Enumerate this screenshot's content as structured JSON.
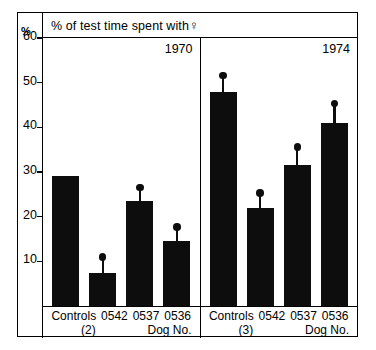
{
  "figure": {
    "title": "% of test time spent with",
    "title_symbol": "♀",
    "y_unit": "%"
  },
  "chart_data": {
    "type": "bar",
    "xlabel": "Dog No.",
    "ylabel": "%",
    "ylim": [
      0,
      60
    ],
    "yticks": [
      10,
      20,
      30,
      40,
      50,
      60
    ],
    "grid": false,
    "legend": "none",
    "panels": [
      {
        "name": "1970",
        "year_label": "1970",
        "control_note": "(2)",
        "categories": [
          "Controls",
          "0542",
          "0537",
          "0536"
        ],
        "values": [
          29.0,
          7.5,
          23.5,
          14.5
        ],
        "error_upper": [
          null,
          11.0,
          26.5,
          17.7
        ]
      },
      {
        "name": "1974",
        "year_label": "1974",
        "control_note": "(3)",
        "categories": [
          "Controls",
          "0542",
          "0537",
          "0536"
        ],
        "values": [
          48.0,
          22.0,
          31.5,
          41.0
        ],
        "error_upper": [
          51.6,
          25.3,
          35.6,
          45.3
        ]
      }
    ]
  },
  "panels": [
    {
      "year": "1970",
      "labels": [
        "Controls",
        "0542",
        "0537",
        "0536"
      ],
      "control_count": "(2)",
      "axis_caption": "Dog No."
    },
    {
      "year": "1974",
      "labels": [
        "Controls",
        "0542",
        "0537",
        "0536"
      ],
      "control_count": "(3)",
      "axis_caption": "Dog No."
    }
  ],
  "colors": {
    "bar": "#0d0d0d",
    "frame": "#000000",
    "background": "#ffffff"
  }
}
